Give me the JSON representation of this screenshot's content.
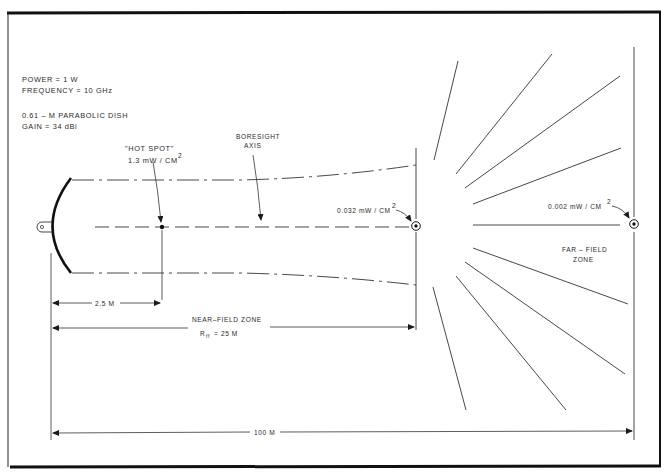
{
  "diagram": {
    "title": "",
    "specs": {
      "power": "POWER = 1 W",
      "frequency": "FREQUENCY = 10 GHz",
      "dish": "0.61 – M  PARABOLIC  DISH",
      "gain": "GAIN = 34 dBi"
    },
    "hot_spot": {
      "label": "\"HOT SPOT\"",
      "value": "1.3 mW / CM",
      "exp": "2"
    },
    "boresight": {
      "line1": "BORESIGHT",
      "line2": "AXIS"
    },
    "near_field_marker": {
      "value": "0.032 mW / CM",
      "exp": "2"
    },
    "far_field_marker": {
      "value": "0.002 mW / CM",
      "exp": "2"
    },
    "far_field_zone": {
      "line1": "FAR – FIELD",
      "line2": "ZONE"
    },
    "dimensions": {
      "hot_spot_distance": "2.5 M",
      "near_field_zone": "NEAR–FIELD  ZONE",
      "rff_symbol": "R",
      "rff_sub": "ff",
      "rff_value": "= 25 M",
      "total_distance": "100 M"
    },
    "colors": {
      "ink": "#1a1a1a",
      "paper": "#ffffff"
    }
  }
}
